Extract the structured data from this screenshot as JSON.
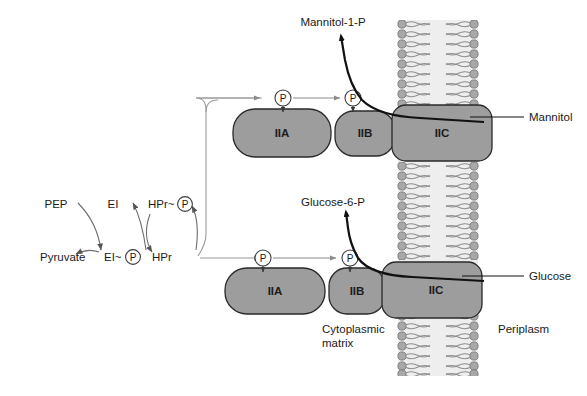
{
  "diagram": {
    "colors": {
      "protein_fill": "#9d9d9d",
      "protein_stroke": "#2a2a2a",
      "membrane_head": "#a8a8a8",
      "membrane_core": "#e8e8e8",
      "substrate_line": "#111111",
      "thin_arrow": "#8a8a8a",
      "background": "#ffffff"
    },
    "cycle": {
      "nodes": [
        {
          "id": "pep",
          "label": "PEP",
          "x": 56,
          "y": 204
        },
        {
          "id": "pyruvate",
          "label": "Pyruvate",
          "x": 40,
          "y": 257
        },
        {
          "id": "ei",
          "label": "EI",
          "x": 113,
          "y": 204
        },
        {
          "id": "ei_p",
          "label": "EI~",
          "x": 110,
          "y": 257
        },
        {
          "id": "hpr_p",
          "label": "HPr~",
          "x": 157,
          "y": 204
        },
        {
          "id": "hpr",
          "label": "HPr",
          "x": 160,
          "y": 257
        }
      ],
      "phosphate_glyph": "P"
    },
    "upper_complex": {
      "name": "mannitol-transport-complex",
      "proteins": [
        {
          "id": "iia",
          "label": "IIA"
        },
        {
          "id": "iib",
          "label": "IIB"
        },
        {
          "id": "iic",
          "label": "IIC"
        }
      ],
      "product_label": "Mannitol-1-P",
      "substrate_label": "Mannitol",
      "phosphate_glyph": "P"
    },
    "lower_complex": {
      "name": "glucose-transport-complex",
      "proteins": [
        {
          "id": "iia",
          "label": "IIA"
        },
        {
          "id": "iib",
          "label": "IIB"
        },
        {
          "id": "iic",
          "label": "IIC"
        }
      ],
      "product_label": "Glucose-6-P",
      "substrate_label": "Glucose",
      "phosphate_glyph": "P"
    },
    "compartments": {
      "cytoplasm_line1": "Cytoplasmic",
      "cytoplasm_line2": "matrix",
      "periplasm": "Periplasm"
    }
  }
}
